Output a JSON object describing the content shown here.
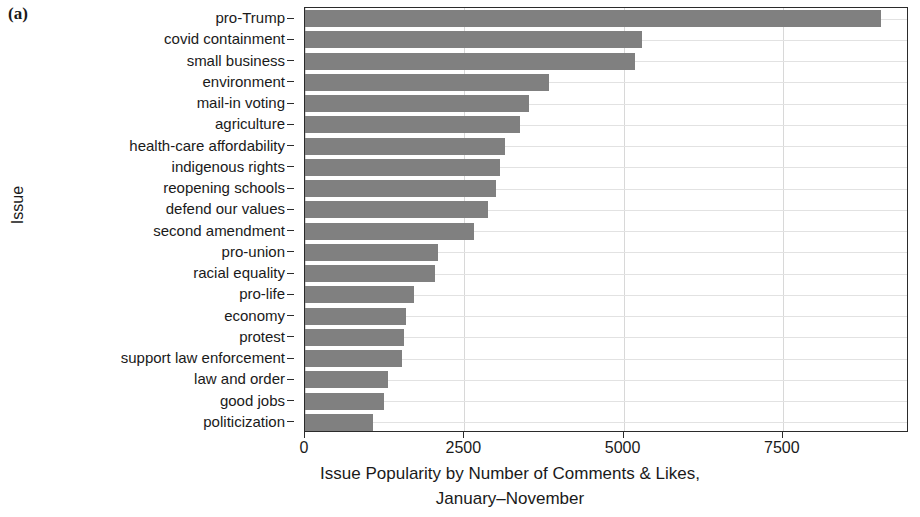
{
  "panel": {
    "label": "(a)"
  },
  "chart_data": {
    "type": "bar",
    "orientation": "horizontal",
    "title": "",
    "subtitle": "",
    "xlabel_line1": "Issue Popularity by Number of Comments & Likes,",
    "xlabel_line2": "January–November",
    "ylabel": "Issue",
    "categories": [
      "pro-Trump",
      "covid containment",
      "small business",
      "environment",
      "mail-in voting",
      "agriculture",
      "health-care affordability",
      "indigenous rights",
      "reopening schools",
      "defend our values",
      "second amendment",
      "pro-union",
      "racial equality",
      "pro-life",
      "economy",
      "protest",
      "support law enforcement",
      "law and order",
      "good jobs",
      "politicization"
    ],
    "values": [
      9040,
      5290,
      5180,
      3830,
      3520,
      3370,
      3140,
      3060,
      3000,
      2870,
      2650,
      2090,
      2040,
      1710,
      1580,
      1550,
      1520,
      1300,
      1240,
      1070
    ],
    "xticks": [
      0,
      2500,
      5000,
      7500
    ],
    "xticklabels": [
      "0",
      "2500",
      "5000",
      "7500"
    ],
    "xlim": [
      0,
      9480
    ],
    "grid": {
      "vertical": true,
      "horizontal": true
    },
    "legend": null,
    "bar_color": "#808080",
    "grid_color": "#d8d8d8",
    "axis_color": "#2b2b2b"
  }
}
